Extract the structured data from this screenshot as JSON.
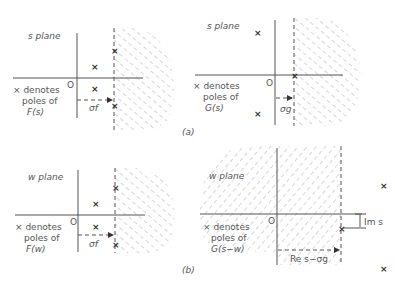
{
  "figure": {
    "panel_a_label": "(a)",
    "panel_b_label": "(b)",
    "a_left": {
      "plane_label": "s plane",
      "origin_label": "O",
      "legend_line1": "× denotes",
      "legend_line2": "poles of",
      "legend_line3": "F(s)",
      "sigma_label": "σf",
      "pole_mark": "×"
    },
    "a_right": {
      "plane_label": "s plane",
      "origin_label": "O",
      "legend_line1": "× denotes",
      "legend_line2": "poles of",
      "legend_line3": "G(s)",
      "sigma_label": "σg",
      "pole_mark": "×"
    },
    "b_left": {
      "plane_label": "w plane",
      "origin_label": "O",
      "legend_line1": "× denotes",
      "legend_line2": "poles of",
      "legend_line3": "F(w)",
      "sigma_label": "σf",
      "pole_mark": "×"
    },
    "b_right": {
      "plane_label": "w plane",
      "origin_label": "O",
      "legend_line1": "× denotes",
      "legend_line2": "poles of",
      "legend_line3": "G(s−w)",
      "im_label": "Im s",
      "re_label": "Re s−σg",
      "pole_mark": "×"
    }
  }
}
